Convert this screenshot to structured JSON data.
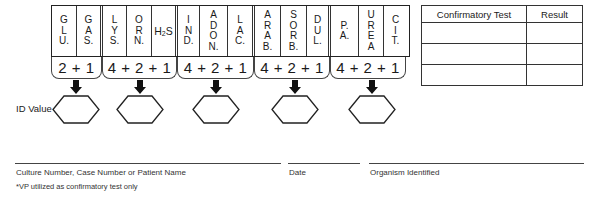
{
  "grid": {
    "columns": [
      {
        "label": [
          "G",
          "L",
          "U."
        ],
        "width": 25,
        "group_end": false
      },
      {
        "label": [
          "G",
          "A",
          "S."
        ],
        "width": 26,
        "group_end": true
      },
      {
        "label": [
          "L",
          "Y",
          "S."
        ],
        "width": 24,
        "group_end": false
      },
      {
        "label": [
          "O",
          "R",
          "N."
        ],
        "width": 25,
        "group_end": false
      },
      {
        "label": [
          "H₂S"
        ],
        "width": 26,
        "group_end": true,
        "horizontal": true
      },
      {
        "label": [
          "I",
          "N",
          "D."
        ],
        "width": 22,
        "group_end": false
      },
      {
        "label": [
          "A",
          "D",
          "O",
          "N."
        ],
        "width": 28,
        "group_end": false
      },
      {
        "label": [
          "L",
          "A",
          "C."
        ],
        "width": 27,
        "group_end": true
      },
      {
        "label": [
          "A",
          "R",
          "A",
          "B."
        ],
        "width": 26,
        "group_end": false
      },
      {
        "label": [
          "S",
          "O",
          "R",
          "B."
        ],
        "width": 26,
        "group_end": false
      },
      {
        "label": [
          "D",
          "U",
          "L."
        ],
        "width": 24,
        "group_end": true
      },
      {
        "label": [
          "P.",
          "A."
        ],
        "width": 28,
        "group_end": false
      },
      {
        "label": [
          "U",
          "R",
          "E",
          "A"
        ],
        "width": 25,
        "group_end": false
      },
      {
        "label": [
          "C",
          "I",
          "T."
        ],
        "width": 23,
        "group_end": false
      }
    ],
    "sums": [
      {
        "label": "2+1",
        "width": 51
      },
      {
        "label": "4+2+1",
        "width": 75
      },
      {
        "label": "4+2+1",
        "width": 77
      },
      {
        "label": "4+2+1",
        "width": 76
      },
      {
        "label": "4+2+1",
        "width": 76
      }
    ]
  },
  "id_value": {
    "label": "ID Value",
    "arrows_x": [
      76,
      140,
      216,
      295,
      372
    ],
    "hexagons_x": [
      52,
      116,
      192,
      271,
      348
    ]
  },
  "confirmatory_table": {
    "headers": [
      "Confirmatory Test",
      "Result"
    ],
    "rows": [
      [
        "",
        ""
      ],
      [
        "",
        ""
      ],
      [
        "",
        ""
      ]
    ]
  },
  "footer": {
    "culture_label": "Culture Number, Case Number or Patient Name",
    "date_label": "Date",
    "organism_label": "Organism Identified",
    "footnote": "*VP utilized as confirmatory test only"
  }
}
